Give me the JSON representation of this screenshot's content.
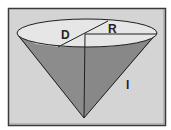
{
  "diagram": {
    "labels": {
      "diameter": "D",
      "radius": "R",
      "slant_height": "l"
    },
    "colors": {
      "background": "#d4d4d4",
      "frame": "#3a3a3a",
      "cone_fill": "#8c8c8c",
      "cone_fill_dark": "#7a7a7a",
      "ellipse_fill": "#e6e6e6",
      "line": "#1e1e1e"
    }
  }
}
